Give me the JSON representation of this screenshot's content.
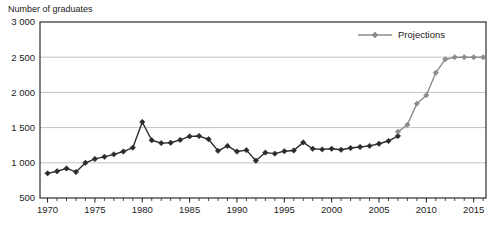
{
  "chart_data": {
    "type": "line",
    "title": "",
    "ylabel": "Number of graduates",
    "xlabel": "",
    "ylim": [
      500,
      3000
    ],
    "xlim": [
      1969.2,
      2016.3
    ],
    "yticks": [
      500,
      1000,
      1500,
      2000,
      2500,
      3000
    ],
    "ytick_labels": [
      "500",
      "1 000",
      "1 500",
      "2 000",
      "2 500",
      "3 000"
    ],
    "xticks": [
      1970,
      1975,
      1980,
      1985,
      1990,
      1995,
      2000,
      2005,
      2010,
      2015
    ],
    "xtick_labels": [
      "1970",
      "1975",
      "1980",
      "1985",
      "1990",
      "1995",
      "2000",
      "2005",
      "2010",
      "2015"
    ],
    "xtick_minor_step": 1,
    "grid": "horizontal",
    "grid_color": "#b3b3b3",
    "axis_color": "#1a1a1a",
    "legend_position": "top-right",
    "legend": [
      {
        "name": "Projections",
        "color": "#8c8c8c",
        "marker": "diamond"
      }
    ],
    "series": [
      {
        "name": "Actual",
        "color": "#2b2b2b",
        "marker": "diamond",
        "x": [
          1970,
          1971,
          1972,
          1973,
          1974,
          1975,
          1976,
          1977,
          1978,
          1979,
          1980,
          1981,
          1982,
          1983,
          1984,
          1985,
          1986,
          1987,
          1988,
          1989,
          1990,
          1991,
          1992,
          1993,
          1994,
          1995,
          1996,
          1997,
          1998,
          1999,
          2000,
          2001,
          2002,
          2003,
          2004,
          2005,
          2006,
          2007
        ],
        "values": [
          850,
          880,
          920,
          870,
          1000,
          1055,
          1085,
          1120,
          1160,
          1215,
          1580,
          1320,
          1280,
          1285,
          1325,
          1375,
          1380,
          1335,
          1170,
          1240,
          1160,
          1180,
          1030,
          1145,
          1130,
          1165,
          1175,
          1290,
          1200,
          1190,
          1200,
          1185,
          1210,
          1225,
          1240,
          1270,
          1310,
          1380
        ]
      },
      {
        "name": "Projections",
        "color": "#8c8c8c",
        "marker": "diamond",
        "x": [
          2007,
          2008,
          2009,
          2010,
          2011,
          2012,
          2013,
          2014,
          2015,
          2016
        ],
        "values": [
          1440,
          1540,
          1840,
          1960,
          2280,
          2470,
          2500,
          2500,
          2500,
          2500
        ]
      }
    ]
  }
}
